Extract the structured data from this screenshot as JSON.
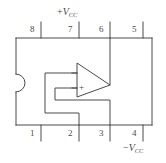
{
  "figure": {
    "kind": "electronic-schematic",
    "stroke_color": "#4a4a4a",
    "background_color": "#ffffff",
    "package": {
      "notch_side": "left",
      "pin_count": 8
    }
  },
  "pins": {
    "top": [
      {
        "number": "8",
        "x": 32,
        "tick_x": 41
      },
      {
        "number": "7",
        "x": 70,
        "tick_x": 79
      },
      {
        "number": "6",
        "x": 101,
        "tick_x": 110
      },
      {
        "number": "5",
        "x": 134,
        "tick_x": 143
      }
    ],
    "bottom": [
      {
        "number": "1",
        "x": 32,
        "tick_x": 41
      },
      {
        "number": "2",
        "x": 70,
        "tick_x": 79
      },
      {
        "number": "3",
        "x": 101,
        "tick_x": 110
      },
      {
        "number": "4",
        "x": 134,
        "tick_x": 143
      }
    ]
  },
  "labels": {
    "supply_positive": {
      "sign": "+",
      "symbol": "V",
      "subscript": "CC",
      "at_pin": "7"
    },
    "supply_negative": {
      "sign": "−",
      "symbol": "V",
      "subscript": "CC",
      "at_pin": "4"
    },
    "noninverting_input_mark": "+"
  },
  "opamp": {
    "symbol": "triangle",
    "inverting_input_pin": "2",
    "noninverting_input_pin": "3",
    "output_pin": "6"
  }
}
